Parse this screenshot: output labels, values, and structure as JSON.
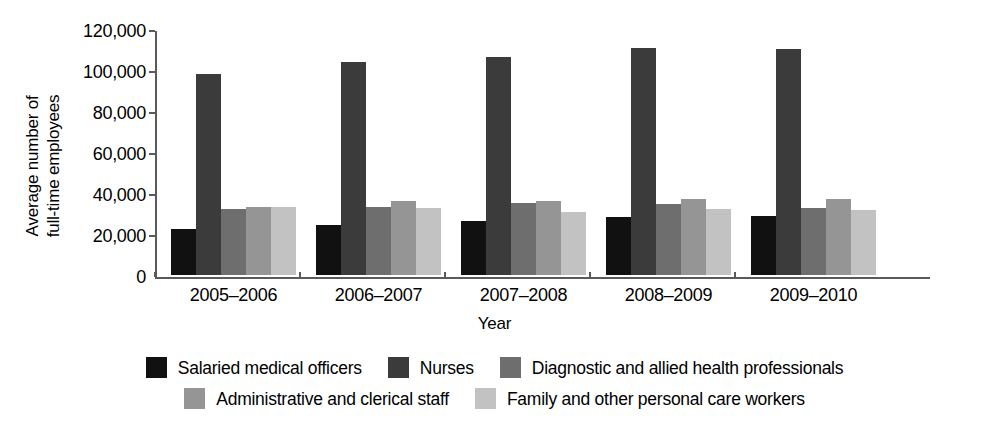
{
  "chart_data": {
    "type": "bar",
    "title": "",
    "xlabel": "Year",
    "ylabel": "Average number of\nfull-time employees",
    "categories": [
      "2005–2006",
      "2006–2007",
      "2007–2008",
      "2008–2009",
      "2009–2010"
    ],
    "ylim": [
      0,
      120000
    ],
    "yticks": [
      0,
      20000,
      40000,
      60000,
      80000,
      100000,
      120000
    ],
    "ytick_labels": [
      "0",
      "20,000",
      "40,000",
      "60,000",
      "80,000",
      "100,000",
      "120,000"
    ],
    "grid": false,
    "legend_position": "bottom",
    "series": [
      {
        "name": "Salaried medical officers",
        "color": "#111111",
        "values": [
          22400,
          24400,
          26300,
          28300,
          28800
        ]
      },
      {
        "name": "Nurses",
        "color": "#3b3b3b",
        "values": [
          98000,
          104000,
          106300,
          110700,
          110200
        ]
      },
      {
        "name": "Diagnostic and allied health professionals",
        "color": "#6e6e6e",
        "values": [
          32200,
          33400,
          35100,
          34600,
          32800
        ]
      },
      {
        "name": "Administrative and clerical staff",
        "color": "#959595",
        "values": [
          33300,
          36200,
          36200,
          36900,
          37300
        ]
      },
      {
        "name": "Family and other personal care workers",
        "color": "#c2c2c2",
        "values": [
          33000,
          32800,
          30600,
          32000,
          31600
        ]
      }
    ]
  }
}
